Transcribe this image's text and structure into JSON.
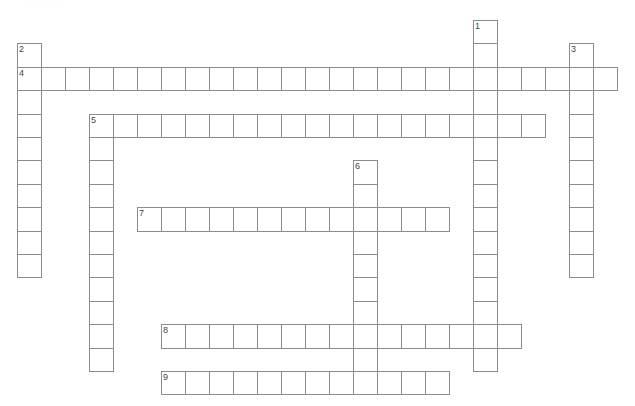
{
  "puzzle": {
    "type": "crossword",
    "grid": {
      "origin_x": 17,
      "origin_y": 20,
      "cell_w": 24,
      "cell_h": 23.4,
      "line_color": "#8c8c8c",
      "number_color": "#444444",
      "background": "#ffffff"
    },
    "entries": [
      {
        "number": "1",
        "direction": "down",
        "col": 19,
        "row": 0,
        "length": 15
      },
      {
        "number": "2",
        "direction": "down",
        "col": 0,
        "row": 1,
        "length": 10
      },
      {
        "number": "3",
        "direction": "down",
        "col": 23,
        "row": 1,
        "length": 10
      },
      {
        "number": "4",
        "direction": "across",
        "col": 0,
        "row": 2,
        "length": 25
      },
      {
        "number": "5",
        "direction": "across",
        "col": 3,
        "row": 4,
        "length": 19
      },
      {
        "number": "5",
        "direction": "down",
        "col": 3,
        "row": 4,
        "length": 11
      },
      {
        "number": "6",
        "direction": "down",
        "col": 14,
        "row": 6,
        "length": 10
      },
      {
        "number": "7",
        "direction": "across",
        "col": 5,
        "row": 8,
        "length": 13
      },
      {
        "number": "8",
        "direction": "across",
        "col": 6,
        "row": 13,
        "length": 15
      },
      {
        "number": "9",
        "direction": "across",
        "col": 6,
        "row": 15,
        "length": 12
      }
    ]
  }
}
